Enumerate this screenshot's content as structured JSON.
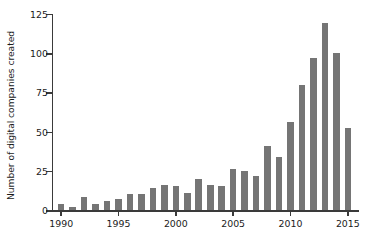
{
  "chart_data": {
    "type": "bar",
    "title": "",
    "subtitle": "",
    "xlabel": "",
    "ylabel": "Number of digital companies created",
    "categories": [
      1990,
      1991,
      1992,
      1993,
      1994,
      1995,
      1996,
      1997,
      1998,
      1999,
      2000,
      2001,
      2002,
      2003,
      2004,
      2005,
      2006,
      2007,
      2008,
      2009,
      2010,
      2011,
      2012,
      2013,
      2014,
      2015
    ],
    "values": [
      4,
      2,
      8,
      4,
      6,
      7,
      10,
      10,
      14,
      16,
      15,
      11,
      20,
      16,
      15,
      26,
      25,
      22,
      41,
      34,
      56,
      80,
      97,
      119,
      100,
      52
    ],
    "xlim": [
      1989.2,
      2015.8
    ],
    "ylim": [
      0,
      125
    ],
    "xticks": [
      1990,
      1995,
      2000,
      2005,
      2010,
      2015
    ],
    "xtick_labels": [
      "1990",
      "1995",
      "2000",
      "2005",
      "2010",
      "2015"
    ],
    "yticks": [
      0,
      25,
      50,
      75,
      100,
      125
    ],
    "ytick_labels": [
      "0",
      "25",
      "50",
      "75",
      "100",
      "125"
    ],
    "grid": false,
    "legend": null,
    "bar_color": "#757575",
    "axis_color": "#3a3a3a",
    "background": "#ffffff"
  }
}
